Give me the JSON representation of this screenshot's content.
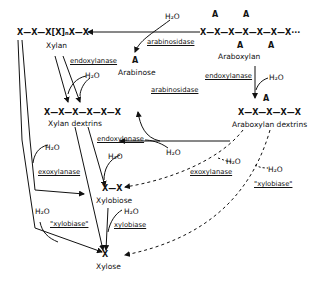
{
  "diagram": {
    "type": "biochemical pathway",
    "nodes": {
      "xylan_chain": "X—X—X[X]ₙX—X",
      "xylan": "Xylan",
      "araboxylan_chain_top": "A   A",
      "araboxylan_chain": "X—X—X—X—X—X—X···",
      "araboxylan_chain_bottom": "A   A",
      "araboxylan": "Araboxylan",
      "arabinose_symbol": "A",
      "arabinose": "Arabinose",
      "xylan_dextrins_chain": "X—X—X—X—X—X",
      "xylan_dextrins": "Xylan  dextrins",
      "araboxylan_dextrins_symbol": "A",
      "araboxylan_dextrins_chain": "X—X—X—X—X",
      "araboxylan_dextrins": "Araboxylan  dextrins",
      "xylobiose_chain": "X—X",
      "xylobiose": "Xylobiose",
      "xylose_symbol": "X",
      "xylose": "Xylose"
    },
    "enzymes": {
      "arabinosidase_top": "arabinosidase",
      "endoxylanase_left": "endoxylanase",
      "endoxylanase_right": "endoxylanase",
      "arabinosidase_mid": "arabinosidase",
      "endoxylanase_mid": "endoxylanase",
      "exoxylanase_left": "exoxylanase",
      "exoxylanase_right": "exoxylanase",
      "xylobiase_left": "\"xylobiase\"",
      "xylobiase_mid": "xylobiase",
      "xylobiase_right": "\"xylobiase\""
    },
    "water": "H₂O"
  }
}
